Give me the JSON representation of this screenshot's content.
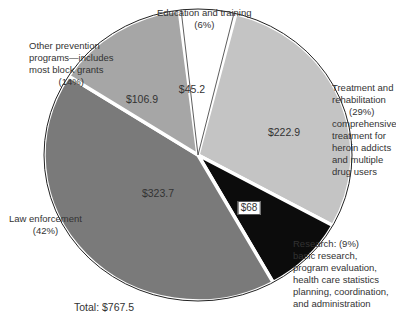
{
  "chart_data": {
    "type": "pie",
    "title": "",
    "total_label": "Total:",
    "total_value": "$767.5",
    "unit": "$ millions",
    "start_angle_deg": -97,
    "slices": [
      {
        "name": "Education and training",
        "pct_label": "(6%)",
        "percent": 6,
        "value": 45.2,
        "value_label": "$45.2",
        "color": "#ffffff",
        "boxed": false
      },
      {
        "name": "Treatment and rehabilitation",
        "pct_label": "(29%)",
        "percent": 29,
        "value": 222.9,
        "value_label": "$222.9",
        "color": "#c4c4c4",
        "boxed": false,
        "description": "comprehensive treatment for heroin addicts and multiple drug users"
      },
      {
        "name": "Research:",
        "pct_label": "(9%)",
        "percent": 9,
        "value": 68,
        "value_label": "$68",
        "color": "#0c0c0c",
        "boxed": true,
        "description": "basic research, program evaluation, health care statistics planning, coordination, and administration"
      },
      {
        "name": "Law enforcement",
        "pct_label": "(42%)",
        "percent": 42,
        "value": 323.7,
        "value_label": "$323.7",
        "color": "#7a7a7a",
        "boxed": false
      },
      {
        "name": "Other prevention programs—includes most block grants",
        "pct_label": "(14%)",
        "percent": 14,
        "value": 106.9,
        "value_label": "$106.9",
        "color": "#a6a6a6",
        "boxed": false
      }
    ]
  },
  "labels": {
    "education": {
      "line1": "Education and training",
      "line2": "(6%)"
    },
    "treatment": {
      "line1": "Treatment and",
      "line2": "rehabilitation",
      "line3": "(29%)",
      "line4": "comprehensive",
      "line5": "treatment for",
      "line6": "heroin addicts",
      "line7": "and multiple",
      "line8": "drug users"
    },
    "research": {
      "line1": "Research:  (9%)",
      "line2": "basic research,",
      "line3": "program evaluation,",
      "line4": "health care statistics",
      "line5": "planning, coordination,",
      "line6": "and administration"
    },
    "law": {
      "line1": "Law enforcement",
      "line2": "(42%)"
    },
    "other": {
      "line1": "Other prevention",
      "line2": "programs—includes",
      "line3": "most block grants",
      "line4": "(14%)"
    }
  },
  "total": {
    "label": "Total:  $767.5"
  }
}
